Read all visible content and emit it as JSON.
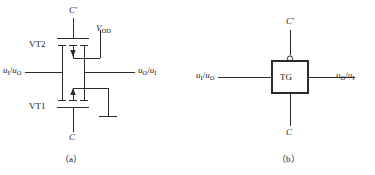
{
  "figure": {
    "background": "#ffffff",
    "line_color": "#2b2b2b",
    "text_color": "#222222"
  },
  "panel_a": {
    "caption": "（a）",
    "labels": {
      "control_top": "C",
      "control_top_prime": "′",
      "control_bottom": "C",
      "supply": "V",
      "supply_sub": "DD",
      "transistor_top": "VT2",
      "transistor_bottom": "VT1",
      "left_port_first": "u",
      "left_port_first_sub": "I",
      "left_port_slash": "/",
      "left_port_second": "u",
      "left_port_second_sub": "O",
      "right_port_first": "u",
      "right_port_first_sub": "O",
      "right_port_slash": "/",
      "right_port_second": "u",
      "right_port_second_sub": "I"
    }
  },
  "panel_b": {
    "caption": "（b）",
    "labels": {
      "control_top": "C",
      "control_top_prime": "′",
      "control_bottom": "C",
      "block": "TG",
      "left_port_first": "u",
      "left_port_first_sub": "I",
      "left_port_slash": "/",
      "left_port_second": "u",
      "left_port_second_sub": "O",
      "right_port_first": "u",
      "right_port_first_sub": "O",
      "right_port_slash": "/",
      "right_port_second": "u",
      "right_port_second_sub": "I"
    }
  }
}
